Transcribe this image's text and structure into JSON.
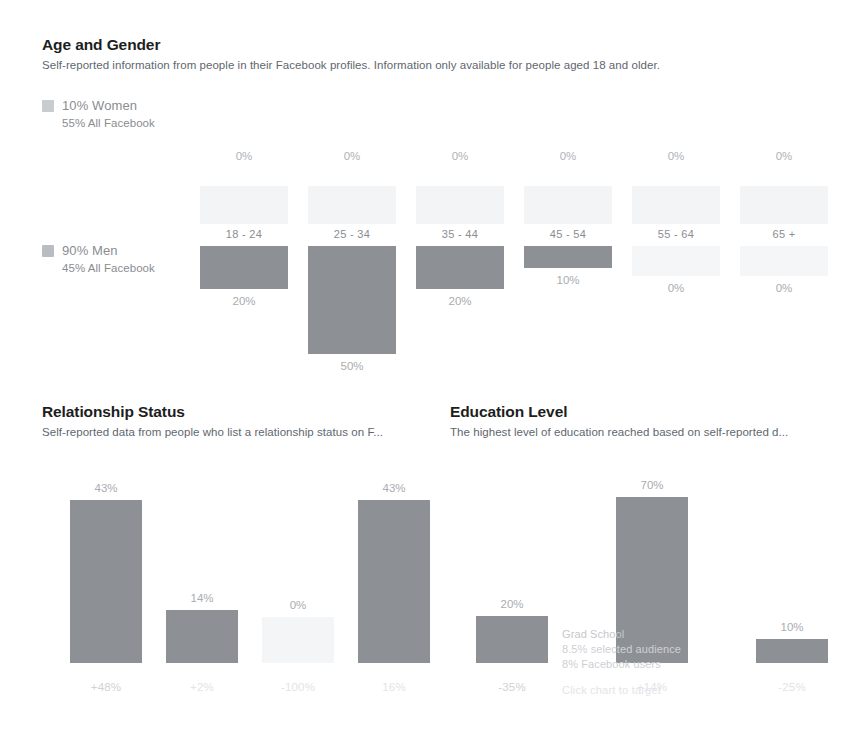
{
  "age_gender": {
    "title": "Age and Gender",
    "subtitle": "Self-reported information from people in their Facebook profiles. Information only available for people aged 18 and older.",
    "legend": {
      "women": {
        "value": "10% Women",
        "benchmark": "55% All Facebook",
        "swatch": "#c8ccd1"
      },
      "men": {
        "value": "90% Men",
        "benchmark": "45% All Facebook",
        "swatch": "#b9bdc2"
      }
    }
  },
  "relationship": {
    "title": "Relationship Status",
    "subtitle": "Self-reported data from people who list a relationship status on F..."
  },
  "education": {
    "title": "Education Level",
    "subtitle": "The highest level of education reached based on self-reported d...",
    "tooltip": {
      "title": "Grad School",
      "line1": "8.5% selected audience",
      "line2": "8% Facebook users",
      "hint": "Click chart to target"
    }
  },
  "chart_data": [
    {
      "type": "bar",
      "title": "Age and Gender",
      "xlabel": "",
      "ylabel": "",
      "ylim": [
        0,
        50
      ],
      "grid": false,
      "legend_position": "left",
      "categories": [
        "18 - 24",
        "25 - 34",
        "35 - 44",
        "45 - 54",
        "55 - 64",
        "65 +"
      ],
      "series": [
        {
          "name": "Women",
          "values": [
            0,
            0,
            0,
            0,
            0,
            0
          ],
          "labels": [
            "0%",
            "0%",
            "0%",
            "0%",
            "0%",
            "0%"
          ],
          "color": "#f3f4f5"
        },
        {
          "name": "Men",
          "values": [
            20,
            50,
            20,
            10,
            0,
            0
          ],
          "labels": [
            "20%",
            "50%",
            "20%",
            "10%",
            "0%",
            "0%"
          ],
          "color": "#8d9196"
        }
      ]
    },
    {
      "type": "bar",
      "title": "Relationship Status",
      "xlabel": "",
      "ylabel": "",
      "ylim": [
        0,
        50
      ],
      "grid": false,
      "categories": [
        "+48%",
        "+2%",
        "-100%",
        "16%"
      ],
      "values": [
        43,
        14,
        0,
        43
      ],
      "labels": [
        "43%",
        "14%",
        "0%",
        "43%"
      ],
      "color": "#8d9196"
    },
    {
      "type": "bar",
      "title": "Education Level",
      "xlabel": "",
      "ylabel": "",
      "ylim": [
        0,
        80
      ],
      "grid": false,
      "categories": [
        "-35%",
        "+14%",
        "-25%"
      ],
      "values": [
        20,
        70,
        10
      ],
      "labels": [
        "20%",
        "70%",
        "10%"
      ],
      "color": "#8d9196"
    }
  ]
}
